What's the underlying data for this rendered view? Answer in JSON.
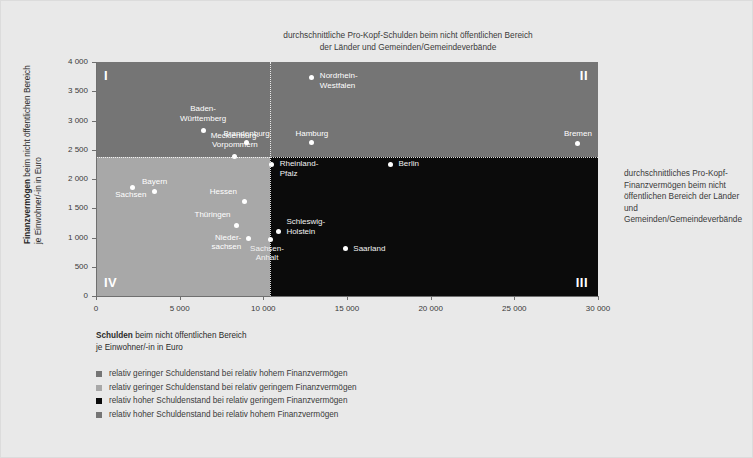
{
  "chart_data": {
    "type": "scatter",
    "title": "durchschnittliche Pro-Kopf-Schulden beim nicht öffentlichen Bereich der Länder und Gemeinden/Gemeindeverbände",
    "title_line1": "durchschnittliche Pro-Kopf-Schulden beim nicht öffentlichen Bereich",
    "title_line2": "der Länder und Gemeinden/Gemeindeverbände",
    "right_annotation": "durchschnittliches Pro-Kopf-Finanzvermögen beim nicht öffentlichen Bereich der Länder und Gemeinden/Gemeindeverbände",
    "xlabel_bold": "Schulden",
    "xlabel_rest": " beim nicht öffentlichen Bereich",
    "xlabel_line2": "je Einwohner/-in in Euro",
    "ylabel_bold": "Finanzvermögen",
    "ylabel_rest": " beim nicht öffentlichen Bereich",
    "ylabel_line2": "je Einwohner/-in in Euro",
    "xlim": [
      0,
      30000
    ],
    "ylim": [
      0,
      4000
    ],
    "xticks": [
      0,
      5000,
      10000,
      15000,
      20000,
      25000,
      30000
    ],
    "xticklabels": [
      "0",
      "5 000",
      "10 000",
      "15 000",
      "20 000",
      "25 000",
      "30 000"
    ],
    "yticks": [
      0,
      500,
      1000,
      1500,
      2000,
      2500,
      3000,
      3500,
      4000
    ],
    "yticklabels": [
      "0",
      "500",
      "1 000",
      "1 500",
      "2 000",
      "2 500",
      "3 000",
      "3 500",
      "4 000"
    ],
    "grid": false,
    "legend_position": "below",
    "reference_lines": {
      "x_mean": 10400,
      "y_mean": 2380
    },
    "quadrant_labels": [
      "I",
      "II",
      "III",
      "IV"
    ],
    "points": [
      {
        "name": "Nordrhein-Westfalen",
        "label_line1": "Nordrhein-",
        "label_line2": "Westfalen",
        "x": 12900,
        "y": 3740,
        "quadrant": "II"
      },
      {
        "name": "Baden-Württemberg",
        "label_line1": "Baden-",
        "label_line2": "Württemberg",
        "x": 6400,
        "y": 2830,
        "quadrant": "I"
      },
      {
        "name": "Brandenburg",
        "label_line1": "Brandenburg",
        "label_line2": "",
        "x": 9000,
        "y": 2620,
        "quadrant": "I"
      },
      {
        "name": "Hamburg",
        "label_line1": "Hamburg",
        "label_line2": "",
        "x": 12900,
        "y": 2620,
        "quadrant": "II"
      },
      {
        "name": "Bremen",
        "label_line1": "Bremen",
        "label_line2": "",
        "x": 28800,
        "y": 2610,
        "quadrant": "II"
      },
      {
        "name": "Mecklenburg-Vorpommern",
        "label_line1": "Mecklenburg-",
        "label_line2": "Vorpommern",
        "x": 8300,
        "y": 2380,
        "quadrant": "I"
      },
      {
        "name": "Rheinland-Pfalz",
        "label_line1": "Rheinland-",
        "label_line2": "Pfalz",
        "x": 10500,
        "y": 2250,
        "quadrant": "III"
      },
      {
        "name": "Berlin",
        "label_line1": "Berlin",
        "label_line2": "",
        "x": 17600,
        "y": 2250,
        "quadrant": "III"
      },
      {
        "name": "Bayern",
        "label_line1": "Bayern",
        "label_line2": "",
        "x": 3500,
        "y": 1790,
        "quadrant": "IV"
      },
      {
        "name": "Sachsen",
        "label_line1": "Sachsen",
        "label_line2": "",
        "x": 2200,
        "y": 1860,
        "quadrant": "IV"
      },
      {
        "name": "Hessen",
        "label_line1": "Hessen",
        "label_line2": "",
        "x": 8900,
        "y": 1620,
        "quadrant": "IV"
      },
      {
        "name": "Thüringen",
        "label_line1": "Thüringen",
        "label_line2": "",
        "x": 8400,
        "y": 1210,
        "quadrant": "IV"
      },
      {
        "name": "Schleswig-Holstein",
        "label_line1": "Schleswig-",
        "label_line2": "Holstein",
        "x": 10900,
        "y": 1110,
        "quadrant": "III"
      },
      {
        "name": "Niedersachsen",
        "label_line1": "Nieder-",
        "label_line2": "sachsen",
        "x": 9100,
        "y": 980,
        "quadrant": "IV"
      },
      {
        "name": "Sachsen-Anhalt",
        "label_line1": "Sachsen-",
        "label_line2": "Anhalt",
        "x": 10400,
        "y": 960,
        "quadrant": "III"
      },
      {
        "name": "Saarland",
        "label_line1": "Saarland",
        "label_line2": "",
        "x": 14900,
        "y": 810,
        "quadrant": "III"
      }
    ],
    "legend": [
      {
        "color": "#757575",
        "text": "relativ geringer Schuldenstand bei relativ hohem Finanzvermögen"
      },
      {
        "color": "#a8a8a8",
        "text": "relativ geringer Schuldenstand bei relativ geringem Finanzvermögen"
      },
      {
        "color": "#0b0b0b",
        "text": "relativ hoher Schuldenstand bei relativ geringem Finanzvermögen"
      },
      {
        "color": "#757575",
        "text": "relativ hoher Schuldenstand bei relativ hohem Finanzvermögen"
      }
    ],
    "colors": {
      "background": "#e9e9e9",
      "quadrant_I": "#757575",
      "quadrant_II": "#757575",
      "quadrant_III": "#0b0b0b",
      "quadrant_IV": "#a8a8a8",
      "point": "#ffffff",
      "text": "#3a3a3a"
    }
  }
}
